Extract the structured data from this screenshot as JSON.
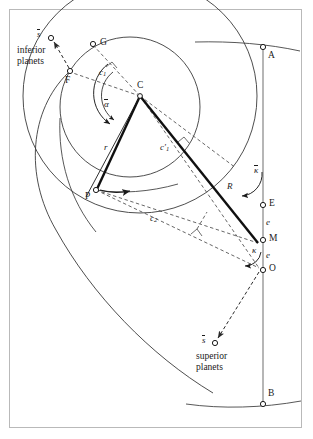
{
  "figure": {
    "width": 313,
    "height": 439,
    "background_color": "#ffffff",
    "frame_color": "#b9b9b9",
    "ink_color": "#1a1a1a",
    "dash_color": "#555555",
    "guide_color": "#7a7a7a"
  },
  "groups": {
    "inferior": {
      "line1": "inferior",
      "line2": "planets"
    },
    "superior": {
      "line1": "superior",
      "line2": "planets"
    }
  },
  "points": {
    "A": "A",
    "B": "B",
    "C": "C",
    "E": "E",
    "F": "F",
    "G": "G",
    "M": "M",
    "O": "O",
    "P": "P"
  },
  "vectors": {
    "r": "r",
    "R": "R"
  },
  "eccentricities": {
    "e_upper": "e",
    "e_lower": "e"
  },
  "angles": {
    "alpha_bar": "α",
    "kappa_bar": "κ",
    "kappa": "κ"
  },
  "chords": {
    "c1": {
      "base": "c",
      "sub": "1",
      "prime": ""
    },
    "c1_prime": {
      "base": "c",
      "sub": "1",
      "prime": "′"
    },
    "c2": {
      "base": "c",
      "sub": "2",
      "prime": ""
    }
  },
  "star_markers": {
    "s_bar_inferior": "s",
    "s_bar_superior": "s"
  }
}
